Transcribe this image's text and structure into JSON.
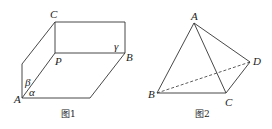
{
  "figure1": {
    "caption": "图1",
    "labels": {
      "C": "C",
      "B": "B",
      "P": "P",
      "A": "A",
      "alpha": "α",
      "beta": "β",
      "gamma": "γ"
    }
  },
  "figure2": {
    "caption": "图2",
    "labels": {
      "A": "A",
      "B": "B",
      "C": "C",
      "D": "D"
    }
  }
}
